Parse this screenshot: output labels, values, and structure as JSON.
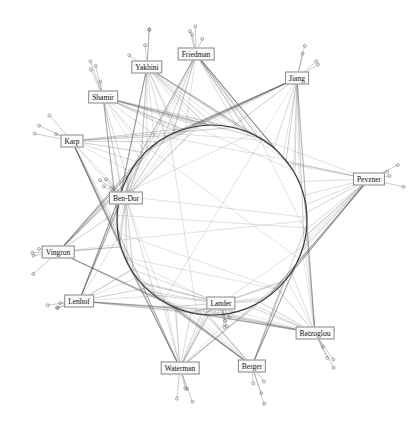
{
  "diagram": {
    "type": "collaboration-network",
    "ring": {
      "cx": 212,
      "cy": 220,
      "r": 95,
      "stroke": "#333333"
    },
    "edge_color": "#555555",
    "nodes": [
      {
        "id": "friedman",
        "label": "Friedman",
        "x": 196,
        "y": 54
      },
      {
        "id": "yakhini",
        "label": "Yakhini",
        "x": 147,
        "y": 67
      },
      {
        "id": "jiang",
        "label": "Jiang",
        "x": 297,
        "y": 78
      },
      {
        "id": "shamir",
        "label": "Shamir",
        "x": 103,
        "y": 97
      },
      {
        "id": "karp",
        "label": "Karp",
        "x": 72,
        "y": 141
      },
      {
        "id": "pevzner",
        "label": "Pevzner",
        "x": 369,
        "y": 179
      },
      {
        "id": "ben-dor",
        "label": "Ben-Dor",
        "x": 126,
        "y": 198
      },
      {
        "id": "vingron",
        "label": "Vingron",
        "x": 58,
        "y": 252
      },
      {
        "id": "lenhof",
        "label": "Lenhof",
        "x": 79,
        "y": 301
      },
      {
        "id": "lander",
        "label": "Lander",
        "x": 221,
        "y": 303
      },
      {
        "id": "batzoglou",
        "label": "Batzoglou",
        "x": 315,
        "y": 333
      },
      {
        "id": "waterman",
        "label": "Waterman",
        "x": 180,
        "y": 368
      },
      {
        "id": "berger",
        "label": "Berger",
        "x": 252,
        "y": 366
      }
    ]
  }
}
